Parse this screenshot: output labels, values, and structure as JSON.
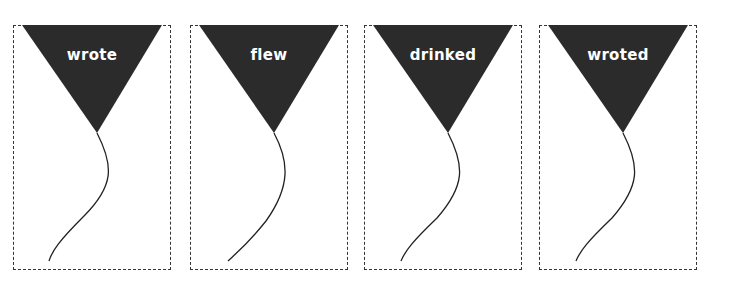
{
  "cards": [
    {
      "word": "wrote",
      "left": 13
    },
    {
      "word": "flew",
      "left": 190
    },
    {
      "word": "drinked",
      "left": 364
    },
    {
      "word": "wroted",
      "left": 539
    }
  ],
  "colors": {
    "pennant": "#2b2b2b",
    "border": "#333333",
    "string": "#222222"
  }
}
